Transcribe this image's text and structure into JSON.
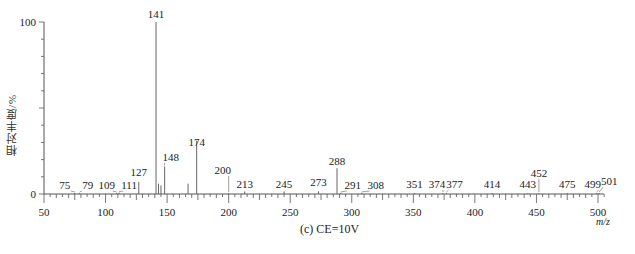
{
  "chart_data": {
    "type": "bar",
    "subtype": "mass-spectrum-stick",
    "title": "",
    "caption": "(c) CE=10V",
    "xlabel": "m/z",
    "ylabel": "相对丰度/%",
    "xlim": [
      50,
      505
    ],
    "ylim": [
      0,
      100
    ],
    "xticks": [
      50,
      100,
      150,
      200,
      250,
      300,
      350,
      400,
      450,
      500
    ],
    "yticks": [
      0,
      100
    ],
    "grid": false,
    "legend": null,
    "peaks": [
      {
        "mz": 75,
        "intensity": 0.5,
        "label": "75"
      },
      {
        "mz": 79,
        "intensity": 0.5,
        "label": "79"
      },
      {
        "mz": 109,
        "intensity": 0.5,
        "label": "109"
      },
      {
        "mz": 111,
        "intensity": 0.8,
        "label": "111"
      },
      {
        "mz": 127,
        "intensity": 7,
        "label": "127"
      },
      {
        "mz": 141,
        "intensity": 100,
        "label": "141"
      },
      {
        "mz": 143,
        "intensity": 6,
        "label": ""
      },
      {
        "mz": 145,
        "intensity": 5,
        "label": ""
      },
      {
        "mz": 148,
        "intensity": 16,
        "label": "148"
      },
      {
        "mz": 167,
        "intensity": 6,
        "label": ""
      },
      {
        "mz": 174,
        "intensity": 31,
        "label": "174"
      },
      {
        "mz": 200,
        "intensity": 0.5,
        "label": "200"
      },
      {
        "mz": 213,
        "intensity": 1.5,
        "label": "213"
      },
      {
        "mz": 245,
        "intensity": 1.5,
        "label": "245"
      },
      {
        "mz": 273,
        "intensity": 1.5,
        "label": "273"
      },
      {
        "mz": 288,
        "intensity": 15,
        "label": "288"
      },
      {
        "mz": 291,
        "intensity": 0.5,
        "label": "291"
      },
      {
        "mz": 308,
        "intensity": 0.5,
        "label": "308"
      },
      {
        "mz": 351,
        "intensity": 0.5,
        "label": "351"
      },
      {
        "mz": 374,
        "intensity": 0.5,
        "label": "374"
      },
      {
        "mz": 377,
        "intensity": 0.5,
        "label": "377"
      },
      {
        "mz": 414,
        "intensity": 0.5,
        "label": "414"
      },
      {
        "mz": 443,
        "intensity": 0.5,
        "label": "443"
      },
      {
        "mz": 452,
        "intensity": 0.5,
        "label": "452"
      },
      {
        "mz": 475,
        "intensity": 0.5,
        "label": "475"
      },
      {
        "mz": 499,
        "intensity": 0.5,
        "label": "499"
      },
      {
        "mz": 501,
        "intensity": 0.5,
        "label": "501"
      }
    ]
  }
}
